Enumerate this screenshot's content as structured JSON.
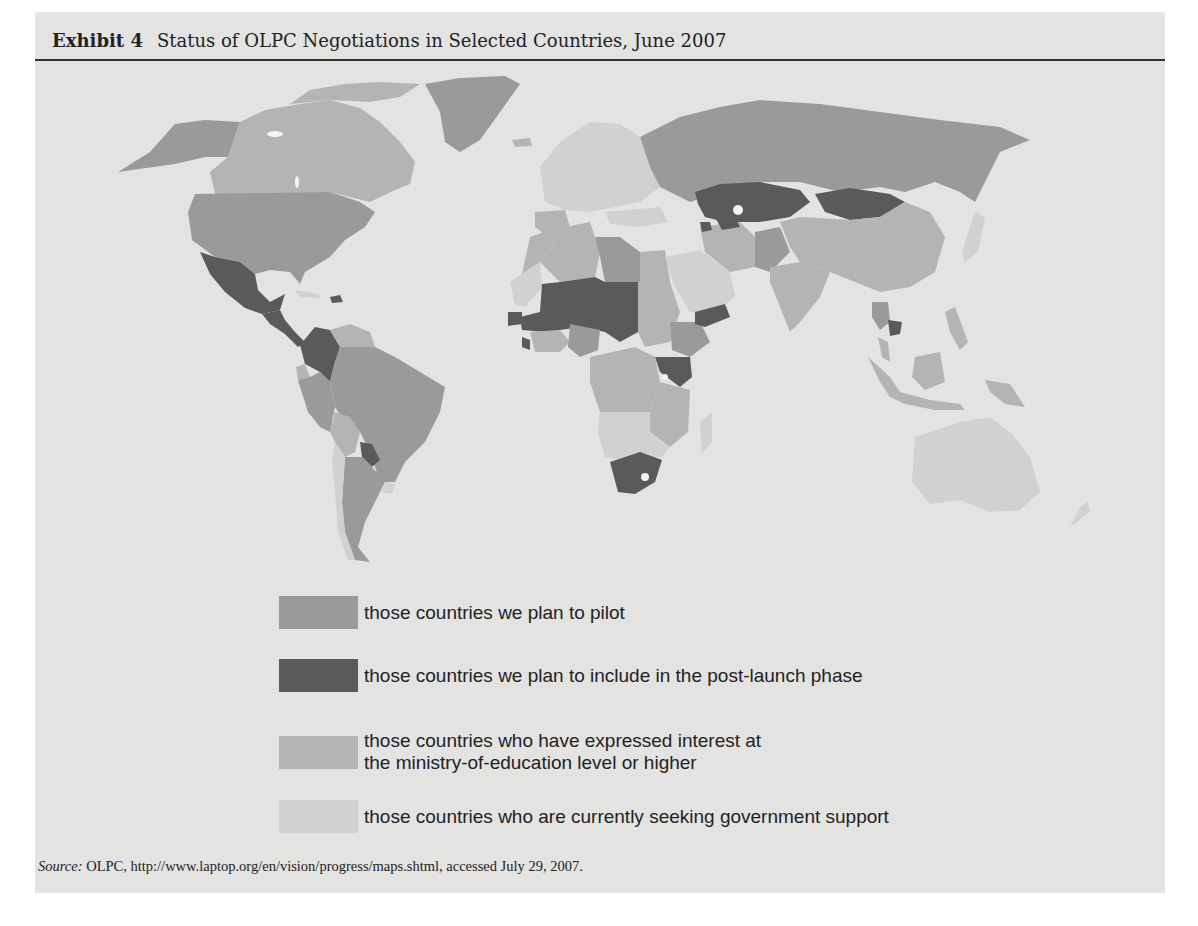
{
  "header": {
    "label": "Exhibit 4",
    "title": "Status of OLPC Negotiations in Selected Countries, June 2007"
  },
  "colors": {
    "background": "#e3e3e2",
    "pilot": "#9a9a9a",
    "post_launch": "#5a5a5a",
    "expressed_interest": "#b4b4b4",
    "seeking_support": "#d1d1d1",
    "ocean": "#e3e3e2"
  },
  "legend": {
    "items": [
      {
        "key": "pilot",
        "text": "those countries we plan to pilot"
      },
      {
        "key": "post_launch",
        "text": "those countries we plan to include in the post-launch phase"
      },
      {
        "key": "expressed_interest",
        "text_line1": "those countries who have expressed interest at",
        "text_line2": "the ministry-of-education level or higher"
      },
      {
        "key": "seeking_support",
        "text": "those countries who are currently seeking government support"
      }
    ]
  },
  "map": {
    "type": "choropleth-world",
    "regions": {
      "pilot": [
        "United States",
        "Alaska",
        "Greenland",
        "Russia",
        "Brazil",
        "Peru",
        "Argentina",
        "Libya",
        "Nigeria",
        "Ethiopia",
        "Thailand",
        "Pakistan"
      ],
      "post_launch": [
        "Mexico",
        "Guatemala",
        "Colombia",
        "Paraguay",
        "Haiti",
        "Mali",
        "Niger",
        "Chad",
        "Senegal",
        "Guinea-Bissau",
        "Sierra Leone",
        "Yemen",
        "Kenya",
        "South Africa",
        "Kazakhstan",
        "Mongolia",
        "Turkmenistan",
        "Azerbaijan",
        "Cambodia"
      ],
      "expressed_interest": [
        "Canada",
        "Venezuela",
        "Bolivia",
        "China",
        "India",
        "Iran",
        "Indonesia",
        "Philippines",
        "Papua New Guinea",
        "Algeria",
        "Sudan",
        "Egypt",
        "Morocco",
        "DR Congo",
        "Angola",
        "Tanzania",
        "Mozambique",
        "Uganda",
        "Burkina Faso",
        "Ghana",
        "Malaysia",
        "Spain"
      ],
      "seeking_support": [
        "Australia",
        "Madagascar",
        "Saudi Arabia",
        "Europe",
        "Turkey",
        "Japan",
        "Chile",
        "Uruguay",
        "Namibia",
        "Botswana",
        "Zambia",
        "Cameroon",
        "Mauritania"
      ]
    }
  },
  "source": {
    "label": "Source:",
    "text": " OLPC, http://www.laptop.org/en/vision/progress/maps.shtml, accessed July 29, 2007."
  }
}
